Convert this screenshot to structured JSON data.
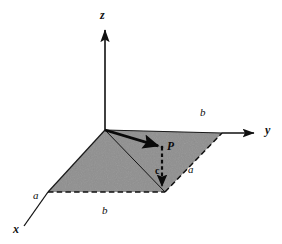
{
  "figure": {
    "background_color": "#ffffff",
    "ink_color": "#111111",
    "plane_fill_color": "#848484",
    "plane_edge_color": "#1a1a1a"
  },
  "axes": [
    {
      "id": "z",
      "label": "z",
      "label_x": 100,
      "label_y": 9,
      "direction": "up"
    },
    {
      "id": "y",
      "label": "y",
      "label_x": 265,
      "label_y": 124,
      "direction": "right"
    },
    {
      "id": "x",
      "label": "x",
      "label_x": 13,
      "label_y": 223,
      "direction": "down-left"
    }
  ],
  "edge_labels": [
    {
      "id": "b-top-right",
      "text": "b",
      "x": 200,
      "y": 107
    },
    {
      "id": "a-right",
      "text": "a",
      "x": 188,
      "y": 164
    },
    {
      "id": "a-left",
      "text": "a",
      "x": 33,
      "y": 190
    },
    {
      "id": "b-bottom",
      "text": "b",
      "x": 102,
      "y": 205
    }
  ],
  "point_labels": [
    {
      "id": "point-p",
      "text": "P",
      "x": 167,
      "y": 141
    }
  ],
  "vector_labels": [
    {
      "id": "vector-c",
      "text": "c",
      "x": 155,
      "y": 166
    }
  ],
  "geometry": {
    "origin": {
      "x": 105,
      "y": 130
    },
    "corner_right": {
      "x": 222,
      "y": 133
    },
    "corner_bottom": {
      "x": 165,
      "y": 192
    },
    "corner_left": {
      "x": 48,
      "y": 192
    },
    "point_p": {
      "x": 162,
      "y": 147
    },
    "foot_of_p": {
      "x": 162,
      "y": 191
    },
    "z_axis_tip": {
      "x": 105,
      "y": 27
    },
    "y_axis_tip": {
      "x": 258,
      "y": 133
    },
    "x_axis_tip": {
      "x": 24,
      "y": 226
    }
  },
  "strokes": {
    "vector_op": {
      "name": "position-vector-arrow",
      "style": "solid-bold"
    },
    "vector_c": {
      "name": "projection-drop-line",
      "style": "dashed-bold"
    },
    "diagonal": {
      "name": "plane-diagonal",
      "style": "solid-thin"
    },
    "front_edges": {
      "name": "plane-front-edges",
      "style": "dashed"
    },
    "back_edges": {
      "name": "plane-back-edges",
      "style": "solid"
    }
  }
}
